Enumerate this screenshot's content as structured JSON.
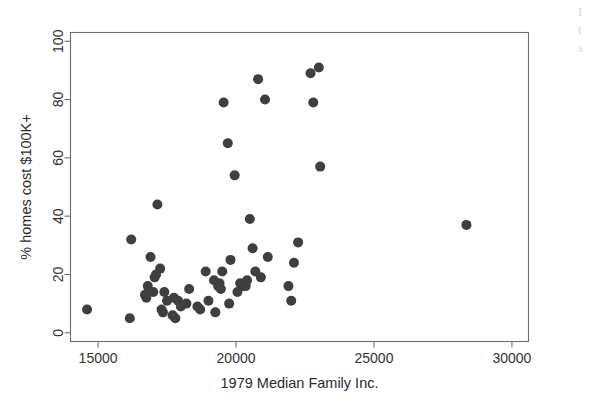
{
  "chart_data": {
    "type": "scatter",
    "title": "",
    "xlabel": "1979 Median Family Inc.",
    "ylabel": "% homes cost $100K+",
    "xlim": [
      14000,
      30600
    ],
    "ylim": [
      -3,
      103
    ],
    "xticks": [
      15000,
      20000,
      25000,
      30000
    ],
    "xtick_labels": [
      "15000",
      "20000",
      "25000",
      "30000"
    ],
    "yticks": [
      0,
      20,
      40,
      60,
      80,
      100
    ],
    "ytick_labels": [
      "0",
      "20",
      "40",
      "60",
      "80",
      "100"
    ],
    "grid": false,
    "legend": "none",
    "marker": "filled-circle",
    "marker_color": "#3f3f3f",
    "marker_size": 10,
    "frame_color": "#6e6e6e",
    "background": "#ffffff",
    "n_points": 57,
    "points": [
      {
        "x": 14600,
        "y": 8
      },
      {
        "x": 16150,
        "y": 5
      },
      {
        "x": 16200,
        "y": 32
      },
      {
        "x": 16700,
        "y": 13
      },
      {
        "x": 16750,
        "y": 12
      },
      {
        "x": 16800,
        "y": 16
      },
      {
        "x": 16900,
        "y": 26
      },
      {
        "x": 17000,
        "y": 14
      },
      {
        "x": 17050,
        "y": 19
      },
      {
        "x": 17100,
        "y": 20
      },
      {
        "x": 17150,
        "y": 44
      },
      {
        "x": 17250,
        "y": 22
      },
      {
        "x": 17300,
        "y": 8
      },
      {
        "x": 17350,
        "y": 7
      },
      {
        "x": 17400,
        "y": 14
      },
      {
        "x": 17500,
        "y": 11
      },
      {
        "x": 17700,
        "y": 6
      },
      {
        "x": 17750,
        "y": 12
      },
      {
        "x": 17800,
        "y": 5
      },
      {
        "x": 17900,
        "y": 11
      },
      {
        "x": 18000,
        "y": 9
      },
      {
        "x": 18200,
        "y": 10
      },
      {
        "x": 18300,
        "y": 15
      },
      {
        "x": 18600,
        "y": 9
      },
      {
        "x": 18700,
        "y": 8
      },
      {
        "x": 18900,
        "y": 21
      },
      {
        "x": 19000,
        "y": 11
      },
      {
        "x": 19200,
        "y": 18
      },
      {
        "x": 19250,
        "y": 7
      },
      {
        "x": 19350,
        "y": 16
      },
      {
        "x": 19400,
        "y": 17
      },
      {
        "x": 19450,
        "y": 15
      },
      {
        "x": 19500,
        "y": 21
      },
      {
        "x": 19550,
        "y": 79
      },
      {
        "x": 19700,
        "y": 65
      },
      {
        "x": 19750,
        "y": 10
      },
      {
        "x": 19800,
        "y": 25
      },
      {
        "x": 19950,
        "y": 54
      },
      {
        "x": 20050,
        "y": 14
      },
      {
        "x": 20150,
        "y": 17
      },
      {
        "x": 20250,
        "y": 16
      },
      {
        "x": 20350,
        "y": 16
      },
      {
        "x": 20400,
        "y": 18
      },
      {
        "x": 20500,
        "y": 39
      },
      {
        "x": 20600,
        "y": 29
      },
      {
        "x": 20700,
        "y": 21
      },
      {
        "x": 20800,
        "y": 87
      },
      {
        "x": 20900,
        "y": 19
      },
      {
        "x": 21050,
        "y": 80
      },
      {
        "x": 21150,
        "y": 26
      },
      {
        "x": 21900,
        "y": 16
      },
      {
        "x": 22000,
        "y": 11
      },
      {
        "x": 22100,
        "y": 24
      },
      {
        "x": 22700,
        "y": 89
      },
      {
        "x": 22800,
        "y": 79
      },
      {
        "x": 23000,
        "y": 91
      },
      {
        "x": 23050,
        "y": 57
      },
      {
        "x": 22250,
        "y": 31
      },
      {
        "x": 28350,
        "y": 37
      }
    ]
  },
  "edge_fragment": {
    "line1": "I",
    "line2": "t",
    "line3": "s"
  }
}
